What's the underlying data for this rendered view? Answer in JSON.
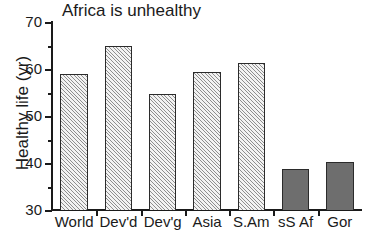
{
  "chart_data": {
    "type": "bar",
    "title": "Africa is unhealthy",
    "xlabel": "",
    "ylabel": "Healthy life (yr)",
    "categories": [
      "World",
      "Dev'd",
      "Dev'g",
      "Asia",
      "S.Am",
      "sS Af",
      "Gor"
    ],
    "values": [
      59.0,
      65.0,
      54.6,
      59.3,
      61.2,
      38.7,
      40.2
    ],
    "series": [
      {
        "name": "Healthy life expectancy",
        "values": [
          59.0,
          65.0,
          54.6,
          59.3,
          61.2,
          38.7,
          40.2
        ]
      }
    ],
    "bar_styles": [
      "hatched",
      "hatched",
      "hatched",
      "hatched",
      "hatched",
      "solid",
      "solid"
    ],
    "ylim": [
      30,
      70
    ],
    "ytick_labels": [
      "70",
      "60",
      "50",
      "40",
      "30"
    ],
    "ytick_values": [
      70,
      60,
      50,
      40,
      30
    ],
    "yminor_values": [
      65,
      55,
      45,
      35
    ],
    "grid": false,
    "legend": "none",
    "colors": {
      "hatched_fill": "#f2f2f2",
      "hatch_line": "#8e8e8e",
      "solid_fill": "#6e6e6e",
      "bar_edge": "#2b2b2b",
      "axis": "#1a1a1a",
      "background": "#ffffff"
    }
  }
}
